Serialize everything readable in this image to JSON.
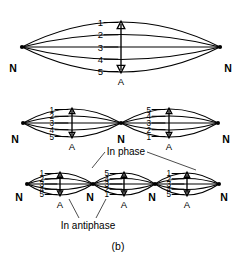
{
  "figure": {
    "caption": "(b)",
    "node_label": "N",
    "antinode_label": "A",
    "annotations": {
      "in_phase": "In phase",
      "in_antiphase": "In antiphase"
    },
    "panels": [
      {
        "name": "fundamental",
        "loop_count": 1,
        "node_labels": [
          "N",
          "N"
        ],
        "antinode_labels": [
          "A"
        ],
        "loops": [
          {
            "curve_labels": [
              "1",
              "2",
              "3",
              "4",
              "5"
            ],
            "order": "descending"
          }
        ]
      },
      {
        "name": "second-harmonic",
        "loop_count": 2,
        "node_labels": [
          "N",
          "N",
          "N"
        ],
        "antinode_labels": [
          "A",
          "A"
        ],
        "loops": [
          {
            "curve_labels": [
              "1",
              "2",
              "3",
              "4",
              "5"
            ],
            "order": "descending"
          },
          {
            "curve_labels": [
              "5",
              "4",
              "3",
              "2",
              "1"
            ],
            "order": "ascending"
          }
        ]
      },
      {
        "name": "third-harmonic",
        "loop_count": 3,
        "node_labels": [
          "N",
          "N",
          "N",
          "N"
        ],
        "antinode_labels": [
          "A",
          "A",
          "A"
        ],
        "loops": [
          {
            "curve_labels": [
              "1",
              "2",
              "3",
              "4",
              "5"
            ],
            "order": "descending"
          },
          {
            "curve_labels": [
              "5",
              "4",
              "3",
              "2",
              "1"
            ],
            "order": "ascending"
          },
          {
            "curve_labels": [
              "1",
              "2",
              "3",
              "4",
              "5"
            ],
            "order": "descending"
          }
        ]
      }
    ]
  }
}
